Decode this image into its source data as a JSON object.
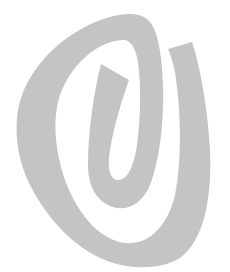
{
  "image": {
    "width": 230,
    "height": 272,
    "background": "#ffffff"
  },
  "logo": {
    "icon": "spiral-logo-icon",
    "fill_color": "#c4c4c4",
    "shape": "single continuous spiral stroke with angled cut ends"
  }
}
